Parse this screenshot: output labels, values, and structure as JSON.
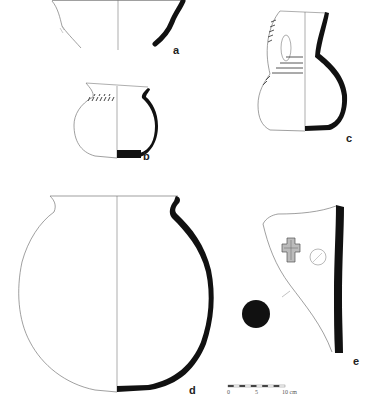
{
  "figure": {
    "ink_color": "#111111",
    "line_color": "#777777"
  },
  "vessels": [
    {
      "id": "a",
      "label": "a",
      "type": "bowl rim fragment"
    },
    {
      "id": "b",
      "label": "b",
      "type": "small jar with incised decoration"
    },
    {
      "id": "c",
      "label": "c",
      "type": "jug with handle and incised bands"
    },
    {
      "id": "d",
      "label": "d",
      "type": "globular pot"
    },
    {
      "id": "e",
      "label": "e",
      "type": "sherd with cross-shaped stamp"
    }
  ],
  "scale_bar": {
    "ticks": [
      "0",
      "5",
      "10 cm"
    ]
  }
}
